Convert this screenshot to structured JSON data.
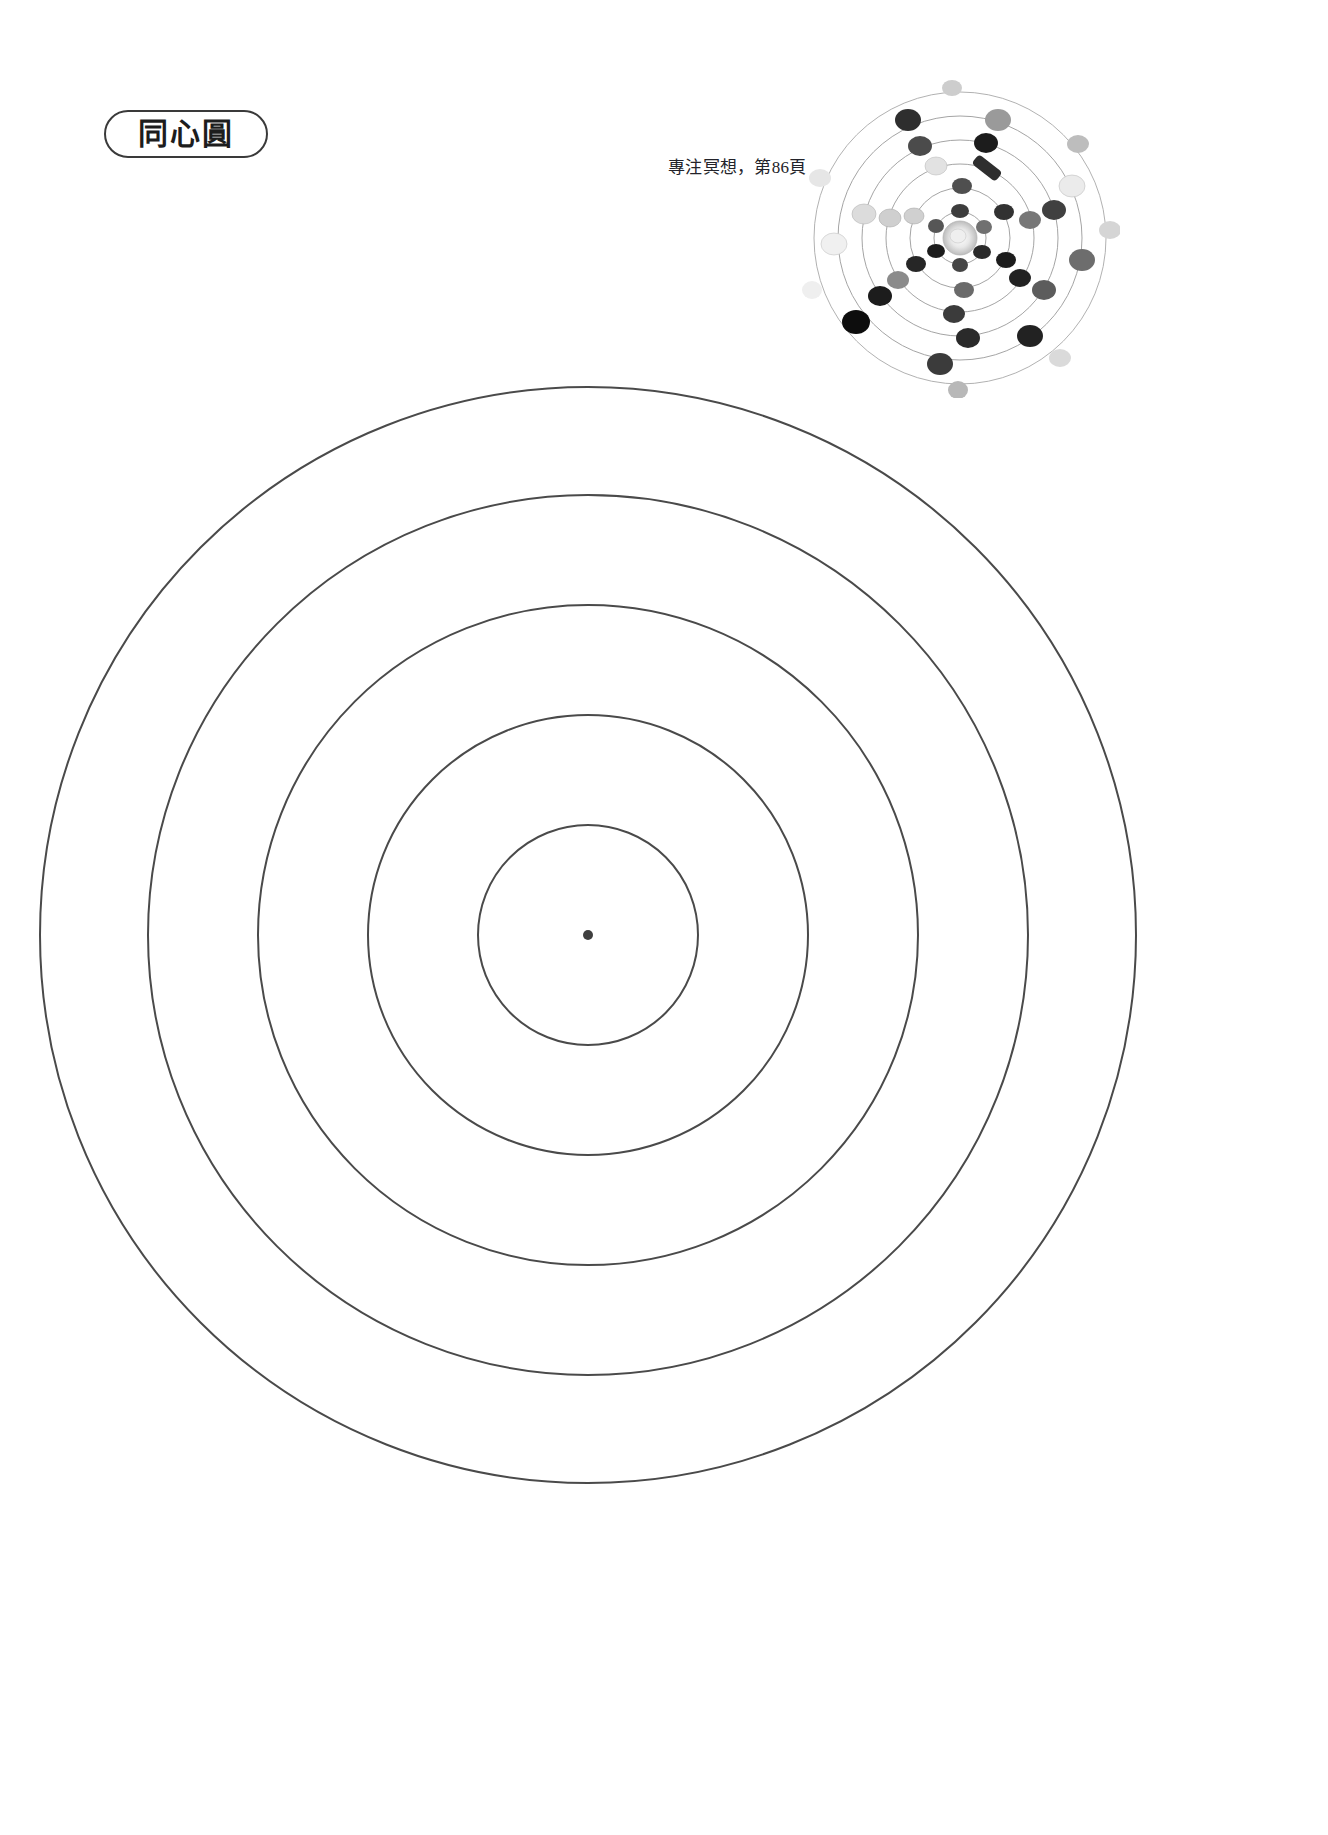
{
  "page": {
    "background_color": "#ffffff",
    "width": 1328,
    "height": 1835
  },
  "header": {
    "title": "同心圓",
    "title_pill_border_color": "#3a3a3a"
  },
  "caption": {
    "text": "專注冥想，第86頁"
  },
  "thumbnail": {
    "alt_name": "crystal-grid-photo",
    "description": "同心圓水晶陣照片",
    "ring_color": "#8a8a8a",
    "stone_color_dark": "#2f2f2f",
    "stone_color_light": "#c9c9c9"
  },
  "chart_data": {
    "type": "concentric-circles",
    "title": "同心圓",
    "center": {
      "x": 588,
      "y": 605
    },
    "stroke_color": "#4a4a4a",
    "stroke_width": 2,
    "fill": "none",
    "center_dot": {
      "radius": 5,
      "color": "#3f3f3f"
    },
    "rings": [
      {
        "index": 1,
        "radius": 110,
        "label": "第一圈"
      },
      {
        "index": 2,
        "radius": 220,
        "label": "第二圈"
      },
      {
        "index": 3,
        "radius": 330,
        "label": "第三圈"
      },
      {
        "index": 4,
        "radius": 440,
        "label": "第四圈"
      },
      {
        "index": 5,
        "radius": 548,
        "label": "第五圈"
      }
    ],
    "ring_count": 5,
    "xlabel": "",
    "ylabel": "",
    "grid": false,
    "legend": false
  },
  "thumb_rings": [
    {
      "r": 26
    },
    {
      "r": 50
    },
    {
      "r": 74
    },
    {
      "r": 98
    },
    {
      "r": 122
    },
    {
      "r": 146
    }
  ]
}
